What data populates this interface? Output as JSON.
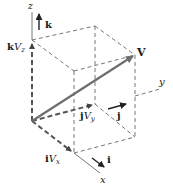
{
  "figure": {
    "axes": {
      "x": "x",
      "y": "y",
      "z": "z"
    },
    "unit_vectors": {
      "i": "i",
      "j": "j",
      "k": "k"
    },
    "components": {
      "x_component": {
        "bold": "i",
        "italic": "V",
        "sub": "x"
      },
      "y_component": {
        "bold": "j",
        "italic": "V",
        "sub": "y"
      },
      "z_component": {
        "bold": "k",
        "italic": "V",
        "sub": "z"
      }
    },
    "vector_label": "V",
    "colors": {
      "vector": "#6e6e6e",
      "lines": "#555555",
      "text": "#1a1a1a"
    }
  }
}
